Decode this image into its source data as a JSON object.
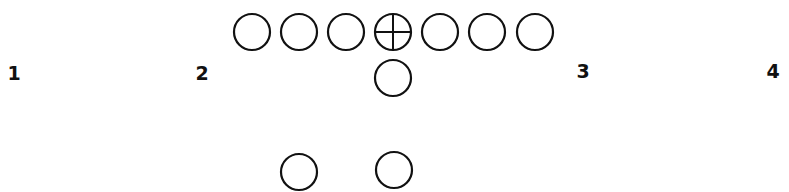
{
  "diagram": {
    "title": "",
    "stroke_color": "#111111",
    "background": "#ffffff",
    "circle_radius": 18,
    "labels": [
      {
        "text": "1",
        "x": 14,
        "y": 73
      },
      {
        "text": "2",
        "x": 202,
        "y": 73
      },
      {
        "text": "3",
        "x": 583,
        "y": 71
      },
      {
        "text": "4",
        "x": 773,
        "y": 71
      }
    ],
    "line": [
      {
        "role": "lineman",
        "x": 252,
        "y": 32,
        "type": "circle"
      },
      {
        "role": "lineman",
        "x": 299,
        "y": 32,
        "type": "circle"
      },
      {
        "role": "lineman",
        "x": 346,
        "y": 32,
        "type": "circle"
      },
      {
        "role": "center",
        "x": 393,
        "y": 32,
        "type": "crossed-circle"
      },
      {
        "role": "lineman",
        "x": 440,
        "y": 32,
        "type": "circle"
      },
      {
        "role": "lineman",
        "x": 487,
        "y": 32,
        "type": "circle"
      },
      {
        "role": "lineman",
        "x": 535,
        "y": 32,
        "type": "circle"
      }
    ],
    "backfield": [
      {
        "role": "quarterback",
        "x": 393,
        "y": 78,
        "type": "circle"
      },
      {
        "role": "back",
        "x": 299,
        "y": 172,
        "type": "circle"
      },
      {
        "role": "back",
        "x": 394,
        "y": 170,
        "type": "circle"
      }
    ]
  }
}
